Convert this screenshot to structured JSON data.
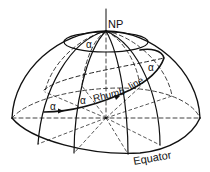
{
  "diagram": {
    "labels": {
      "pole": "NP",
      "rhumb": "Rhumb",
      "line": "line",
      "equator": "Equator",
      "angle": "α"
    },
    "colors": {
      "stroke": "#111111",
      "background": "#ffffff"
    }
  }
}
